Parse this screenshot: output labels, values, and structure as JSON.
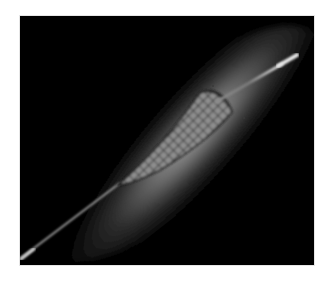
{
  "image": {
    "subject": "Embolic protection filter basket on a guidewire",
    "style": "grayscale photograph",
    "background": {
      "outer": "#ffffff",
      "frame": "#000000",
      "glow_center": "#8a8a8a"
    },
    "elements": [
      {
        "name": "guidewire",
        "description": "thin bright wire running diagonally from bottom-left to top-right"
      },
      {
        "name": "filter-basket",
        "description": "conical mesh basket tapered toward bottom-left, open mouth toward top-right"
      },
      {
        "name": "wire-tip",
        "description": "brighter flexible tip at top-right end of wire"
      }
    ],
    "colors": {
      "wire": "#d8d8d8",
      "mesh": "#2a2a2a",
      "glow": "#909090"
    }
  }
}
